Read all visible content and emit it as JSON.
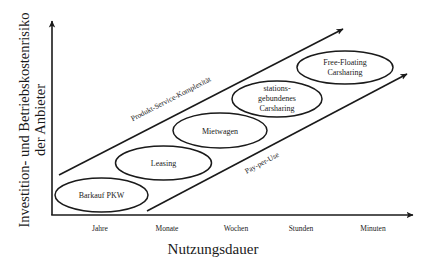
{
  "diagram": {
    "type": "positioning-diagram",
    "y_axis": {
      "label_line1": "Investition- und Betriebskostenrisiko",
      "label_line2": "der Anbieter"
    },
    "x_axis": {
      "label": "Nutzungsdauer",
      "ticks": [
        "Jahre",
        "Monate",
        "Wochen",
        "Stunden",
        "Minuten"
      ]
    },
    "arrows": {
      "upper": {
        "label": "Produkt-Service-Komplexität"
      },
      "lower": {
        "label": "Pay-per-Use"
      }
    },
    "nodes": [
      {
        "lines": [
          "Barkauf PKW"
        ]
      },
      {
        "lines": [
          "Leasing"
        ]
      },
      {
        "lines": [
          "Mietwagen"
        ]
      },
      {
        "lines": [
          "stations-",
          "gebundenes",
          "Carsharing"
        ]
      },
      {
        "lines": [
          "Free-Floating",
          "Carsharing"
        ]
      }
    ],
    "colors": {
      "stroke": "#1a1a1a",
      "background": "#ffffff"
    }
  }
}
